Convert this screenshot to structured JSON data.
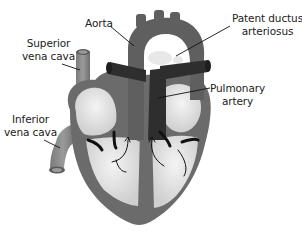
{
  "diagram": {
    "labels": {
      "aorta": "Aorta",
      "superior_vena_cava": [
        "Superior",
        "vena cava"
      ],
      "inferior_vena_cava": [
        "Inferior",
        "vena cava"
      ],
      "patent_ductus_arteriosus": [
        "Patent ductus",
        "arteriosus"
      ],
      "pulmonary_artery": [
        "Pulmonary",
        "artery"
      ]
    },
    "colors": {
      "wall": "#6b6b6b",
      "dark_vessel": "#2e2e2e",
      "chamber": "#e6e6e6",
      "vessel_light": "#8a8a8a",
      "leader_line": "#111111",
      "background": "#ffffff"
    }
  }
}
